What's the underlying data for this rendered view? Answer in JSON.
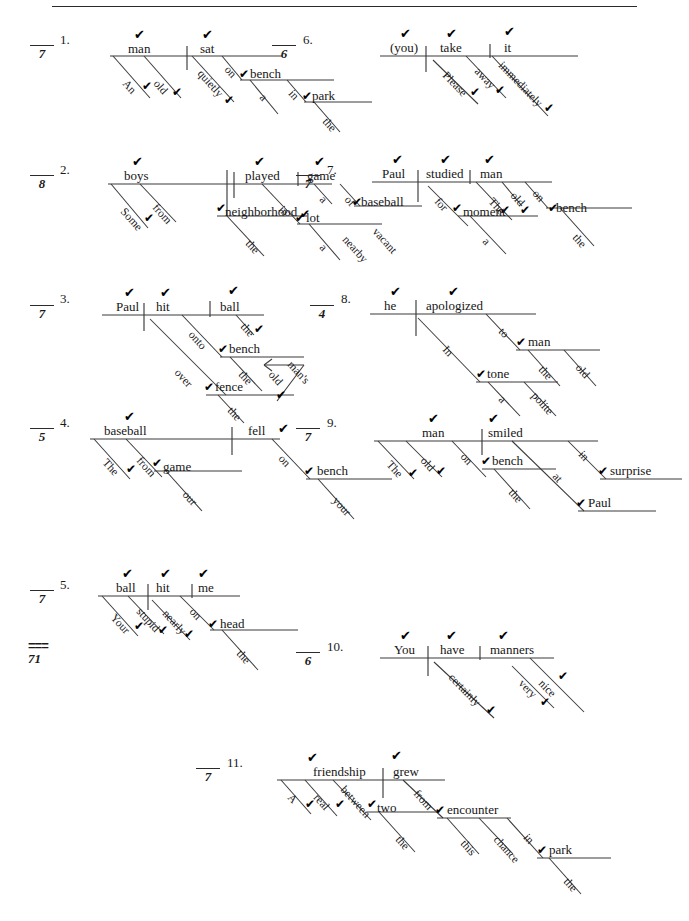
{
  "document": {
    "type": "graded-worksheet",
    "subject": "Reed-Kellogg sentence diagrams",
    "check_mark": "✔",
    "total_label": "===",
    "total_score": "71",
    "top_rule": true
  },
  "items": [
    {
      "number": "1.",
      "score": "7",
      "sentence": "An old man sat quietly on a bench in the park.",
      "words": [
        {
          "text": "man",
          "check": true
        },
        {
          "text": "sat",
          "check": true
        },
        {
          "text": "An",
          "check": true
        },
        {
          "text": "old",
          "check": true
        },
        {
          "text": "quietly",
          "check": true
        },
        {
          "text": "on",
          "check": false
        },
        {
          "text": "bench",
          "check": true
        },
        {
          "text": "a",
          "check": false
        },
        {
          "text": "in",
          "check": false
        },
        {
          "text": "park",
          "check": true
        },
        {
          "text": "the",
          "check": false
        }
      ]
    },
    {
      "number": "2.",
      "score": "8",
      "sentence": "Some boys from the neighborhood played a game of baseball in a nearby vacant lot.",
      "words": [
        {
          "text": "boys",
          "check": true
        },
        {
          "text": "played",
          "check": true
        },
        {
          "text": "game",
          "check": true
        },
        {
          "text": "Some",
          "check": true
        },
        {
          "text": "from",
          "check": false
        },
        {
          "text": "neighborhood",
          "check": true
        },
        {
          "text": "the",
          "check": false
        },
        {
          "text": "a",
          "check": false
        },
        {
          "text": "of",
          "check": false
        },
        {
          "text": "baseball",
          "check": true
        },
        {
          "text": "in",
          "check": true
        },
        {
          "text": "lot",
          "check": true
        },
        {
          "text": "a",
          "check": false
        },
        {
          "text": "nearby",
          "check": false
        },
        {
          "text": "vacant",
          "check": false
        }
      ]
    },
    {
      "number": "3.",
      "score": "7",
      "sentence": "Paul hit the ball over the fence onto the old man's bench.",
      "words": [
        {
          "text": "Paul",
          "check": true
        },
        {
          "text": "hit",
          "check": true
        },
        {
          "text": "ball",
          "check": true
        },
        {
          "text": "the",
          "check": true
        },
        {
          "text": "onto",
          "check": false
        },
        {
          "text": "bench",
          "check": true
        },
        {
          "text": "the",
          "check": false
        },
        {
          "text": "man's",
          "check": false
        },
        {
          "text": "old",
          "check": true
        },
        {
          "text": "over",
          "check": false
        },
        {
          "text": "fence",
          "check": true
        },
        {
          "text": "the",
          "check": false
        }
      ]
    },
    {
      "number": "4.",
      "score": "5",
      "sentence": "The baseball from our game fell on your bench.",
      "words": [
        {
          "text": "baseball",
          "check": true
        },
        {
          "text": "fell",
          "check": true
        },
        {
          "text": "The",
          "check": true
        },
        {
          "text": "from",
          "check": false
        },
        {
          "text": "game",
          "check": true
        },
        {
          "text": "our",
          "check": false
        },
        {
          "text": "on",
          "check": false
        },
        {
          "text": "bench",
          "check": true
        },
        {
          "text": "your",
          "check": false
        }
      ]
    },
    {
      "number": "5.",
      "score": "7",
      "sentence": "Your stupid ball nearly hit me on the head.",
      "words": [
        {
          "text": "ball",
          "check": true
        },
        {
          "text": "hit",
          "check": true
        },
        {
          "text": "me",
          "check": true
        },
        {
          "text": "Your",
          "check": true
        },
        {
          "text": "stupid",
          "check": true
        },
        {
          "text": "nearly",
          "check": true
        },
        {
          "text": "on",
          "check": false
        },
        {
          "text": "head",
          "check": true
        },
        {
          "text": "the",
          "check": false
        }
      ]
    },
    {
      "number": "6.",
      "score": "6",
      "sentence": "Please take it away immediately.",
      "words": [
        {
          "text": "(you)",
          "check": true
        },
        {
          "text": "take",
          "check": true
        },
        {
          "text": "it",
          "check": true
        },
        {
          "text": "Please",
          "check": true
        },
        {
          "text": "away",
          "check": true
        },
        {
          "text": "immediately",
          "check": true
        }
      ]
    },
    {
      "number": "7.",
      "score": "7",
      "sentence": "Paul studied the old man on the bench for a moment.",
      "words": [
        {
          "text": "Paul",
          "check": true
        },
        {
          "text": "studied",
          "check": true
        },
        {
          "text": "man",
          "check": true
        },
        {
          "text": "The",
          "check": true
        },
        {
          "text": "old",
          "check": true
        },
        {
          "text": "on",
          "check": false
        },
        {
          "text": "bench",
          "check": true
        },
        {
          "text": "the",
          "check": false
        },
        {
          "text": "for",
          "check": true
        },
        {
          "text": "moment",
          "check": false
        },
        {
          "text": "a",
          "check": false
        }
      ]
    },
    {
      "number": "8.",
      "score": "4",
      "sentence": "In a polite tone he apologized to the old man.",
      "words": [
        {
          "text": "he",
          "check": true
        },
        {
          "text": "apologized",
          "check": true
        },
        {
          "text": "to",
          "check": false
        },
        {
          "text": "man",
          "check": true
        },
        {
          "text": "the",
          "check": false
        },
        {
          "text": "old",
          "check": false
        },
        {
          "text": "In",
          "check": false
        },
        {
          "text": "tone",
          "check": true
        },
        {
          "text": "a",
          "check": false
        },
        {
          "text": "polite",
          "check": false
        }
      ]
    },
    {
      "number": "9.",
      "score": "7",
      "sentence": "The old man on the bench smiled at Paul in surprise.",
      "words": [
        {
          "text": "man",
          "check": true
        },
        {
          "text": "smiled",
          "check": true
        },
        {
          "text": "The",
          "check": true
        },
        {
          "text": "old",
          "check": true
        },
        {
          "text": "on",
          "check": false
        },
        {
          "text": "bench",
          "check": true
        },
        {
          "text": "the",
          "check": false
        },
        {
          "text": "at",
          "check": false
        },
        {
          "text": "Paul",
          "check": true
        },
        {
          "text": "in",
          "check": false
        },
        {
          "text": "surprise",
          "check": true
        }
      ]
    },
    {
      "number": "10.",
      "score": "6",
      "sentence": "You certainly have very nice manners.",
      "words": [
        {
          "text": "You",
          "check": true
        },
        {
          "text": "have",
          "check": true
        },
        {
          "text": "manners",
          "check": true
        },
        {
          "text": "certainly",
          "check": true
        },
        {
          "text": "nice",
          "check": true
        },
        {
          "text": "very",
          "check": true
        }
      ]
    },
    {
      "number": "11.",
      "score": "7",
      "sentence": "A real friendship grew between the two from this chance encounter in the park.",
      "words": [
        {
          "text": "friendship",
          "check": true
        },
        {
          "text": "grew",
          "check": true
        },
        {
          "text": "A",
          "check": true
        },
        {
          "text": "real",
          "check": true
        },
        {
          "text": "between",
          "check": false
        },
        {
          "text": "two",
          "check": true
        },
        {
          "text": "the",
          "check": false
        },
        {
          "text": "from",
          "check": false
        },
        {
          "text": "encounter",
          "check": true
        },
        {
          "text": "this",
          "check": false
        },
        {
          "text": "chance",
          "check": false
        },
        {
          "text": "in",
          "check": false
        },
        {
          "text": "park",
          "check": true
        },
        {
          "text": "the",
          "check": false
        }
      ]
    }
  ]
}
